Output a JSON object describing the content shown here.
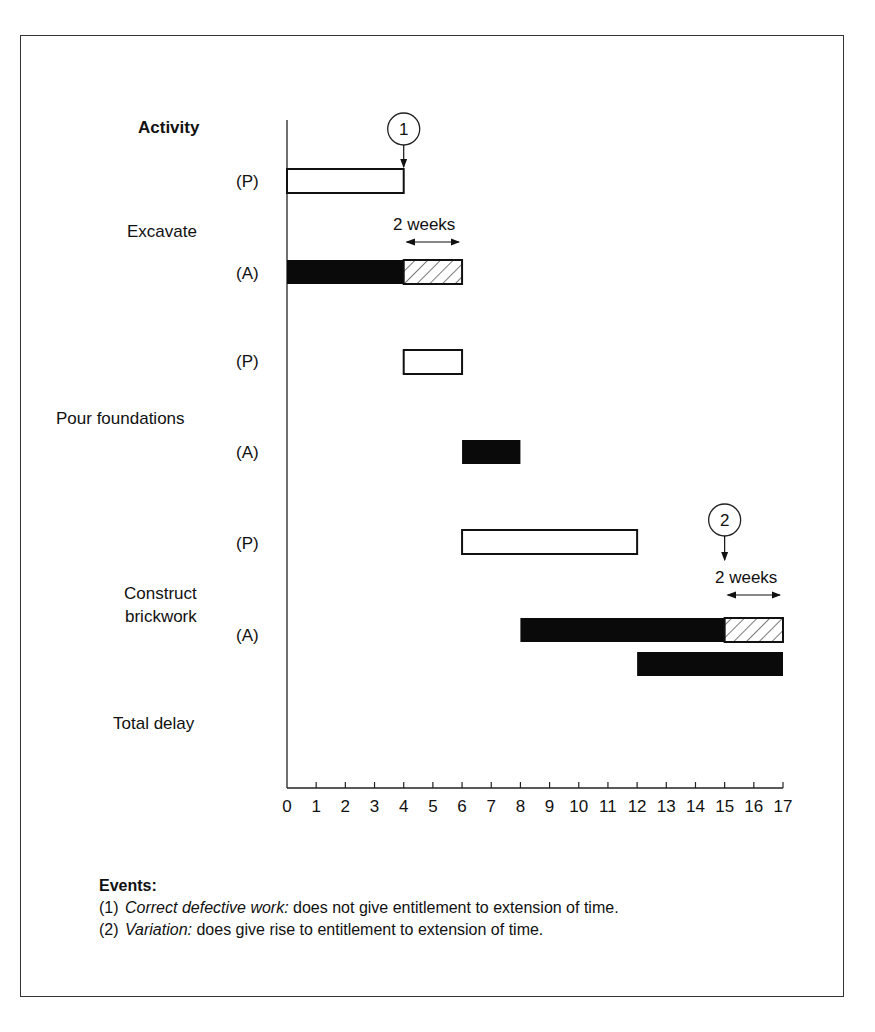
{
  "chart_data": {
    "type": "gantt",
    "title": "",
    "ylabel": "Activity",
    "xlabel": "",
    "x_unit": "weeks",
    "xlim": [
      0,
      17
    ],
    "xticks": [
      0,
      1,
      2,
      3,
      4,
      5,
      6,
      7,
      8,
      9,
      10,
      11,
      12,
      13,
      14,
      15,
      16,
      17
    ],
    "legend": {
      "P": "Planned (open bar)",
      "A": "Actual (solid bar)",
      "hatched": "Delay"
    },
    "activities": [
      {
        "name": "Excavate",
        "planned": {
          "label": "(P)",
          "start": 0,
          "end": 4
        },
        "actual": {
          "label": "(A)",
          "start": 0,
          "end": 6,
          "solid_end": 4,
          "delay": [
            4,
            6
          ]
        }
      },
      {
        "name": "Pour foundations",
        "planned": {
          "label": "(P)",
          "start": 4,
          "end": 6
        },
        "actual": {
          "label": "(A)",
          "start": 6,
          "end": 8,
          "solid_end": 8
        }
      },
      {
        "name": "Construct brickwork",
        "planned": {
          "label": "(P)",
          "start": 6,
          "end": 12
        },
        "actual": {
          "label": "(A)",
          "start": 8,
          "end": 17,
          "solid_end": 15,
          "delay": [
            15,
            17
          ]
        }
      },
      {
        "name": "Total delay",
        "bar": {
          "start": 12,
          "end": 17
        }
      }
    ],
    "annotations": [
      {
        "marker": "1",
        "x": 4,
        "text": "2 weeks",
        "span": [
          4,
          6
        ]
      },
      {
        "marker": "2",
        "x": 15,
        "text": "2 weeks",
        "span": [
          15,
          17
        ]
      }
    ]
  },
  "labels": {
    "activity_header": "Activity",
    "excavate": "Excavate",
    "pour": "Pour foundations",
    "brick_line1": "Construct",
    "brick_line2": "brickwork",
    "total_delay": "Total delay",
    "p": "(P)",
    "a": "(A)",
    "marker1": "1",
    "marker2": "2",
    "two_weeks": "2 weeks"
  },
  "events": {
    "heading": "Events:",
    "items": [
      {
        "num": "(1)",
        "title": "Correct defective work:",
        "text": " does not give entitlement to extension of time."
      },
      {
        "num": "(2)",
        "title": "Variation:",
        "text": " does give rise to entitlement to extension of time."
      }
    ]
  }
}
